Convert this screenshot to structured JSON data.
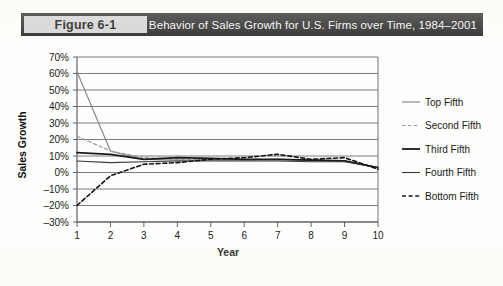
{
  "header": {
    "figure_number": "Figure 6-1",
    "title": "Behavior of Sales Growth for U.S. Firms over Time, 1984–2001",
    "bar_color": "#262626",
    "number_box_color": "#d4d4d4",
    "title_text_color": "#f4f4f4"
  },
  "chart_data": {
    "type": "line",
    "title": "Behavior of Sales Growth for U.S. Firms over Time, 1984–2001",
    "xlabel": "Year",
    "ylabel": "Sales Growth",
    "x": [
      1,
      2,
      3,
      4,
      5,
      6,
      7,
      8,
      9,
      10
    ],
    "xtick_labels": [
      "1",
      "2",
      "3",
      "4",
      "5",
      "6",
      "7",
      "8",
      "9",
      "10"
    ],
    "ytick_labels": [
      "70%",
      "60%",
      "50%",
      "40%",
      "30%",
      "20%",
      "10%",
      "0%",
      "–10%",
      "–20%",
      "–30%"
    ],
    "ytick_values": [
      70,
      60,
      50,
      40,
      30,
      20,
      10,
      0,
      -10,
      -20,
      -30
    ],
    "ylim": [
      -30,
      70
    ],
    "xlim": [
      1,
      10
    ],
    "grid": "horizontal",
    "legend_position": "right",
    "series": [
      {
        "name": "Top Fifth",
        "values": [
          61,
          13,
          8,
          7.5,
          7.5,
          7.5,
          8,
          7.5,
          7,
          3
        ],
        "color": "#8a8a8a",
        "dash": "none",
        "width": 1.2
      },
      {
        "name": "Second Fifth",
        "values": [
          22,
          13,
          9,
          8,
          8,
          8,
          8,
          7.5,
          7,
          3
        ],
        "color": "#9a9a9a",
        "dash": "dashed",
        "width": 1.2
      },
      {
        "name": "Third Fifth",
        "values": [
          12,
          11,
          8,
          9,
          8.5,
          8,
          8,
          7.5,
          7,
          3
        ],
        "color": "#1a1a1a",
        "dash": "none",
        "width": 1.8
      },
      {
        "name": "Fourth Fifth",
        "values": [
          7,
          6,
          6.5,
          7,
          7,
          7,
          7,
          6.5,
          6.5,
          3
        ],
        "color": "#3a3a3a",
        "dash": "none",
        "width": 1.1
      },
      {
        "name": "Bottom Fifth",
        "values": [
          -20,
          -2,
          5,
          6,
          8,
          9,
          11,
          8,
          9,
          2
        ],
        "color": "#141414",
        "dash": "dashed",
        "width": 1.6
      }
    ]
  }
}
